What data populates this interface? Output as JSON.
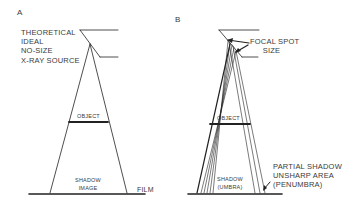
{
  "figure": {
    "panel_a": {
      "letter": "A",
      "source_label": [
        "THEORETICAL",
        "IDEAL",
        "NO-SIZE",
        "X-RAY SOURCE"
      ],
      "object_label": "OBJECT",
      "shadow_label": [
        "SHADOW",
        "IMAGE"
      ],
      "film_label": "FILM"
    },
    "panel_b": {
      "letter": "B",
      "focal_label": [
        "FOCAL SPOT",
        "SIZE"
      ],
      "object_label": "OBJECT",
      "shadow_label": [
        "SHADOW",
        "(UMBRA)"
      ],
      "penumbra_label": [
        "PARTIAL SHADOW",
        "UNSHARP AREA",
        "(PENUMBRA)"
      ]
    },
    "colors": {
      "line": "#222222",
      "text": "#3a3a3a",
      "background": "#ffffff"
    }
  }
}
